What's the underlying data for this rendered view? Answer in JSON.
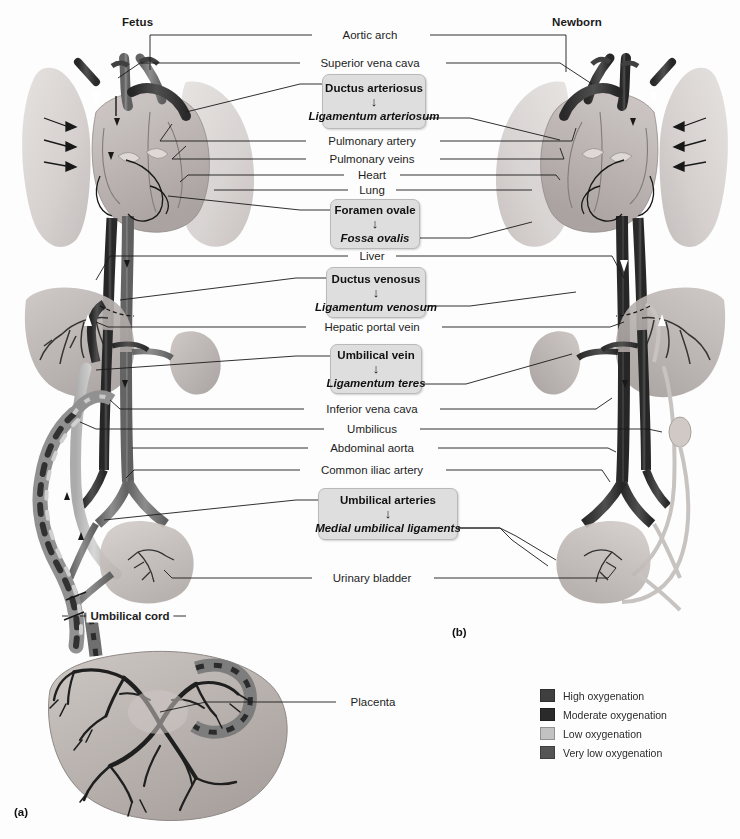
{
  "figure": {
    "panel_a_letter": "(a)",
    "panel_b_letter": "(b)",
    "left_title": "Fetus",
    "right_title": "Newborn"
  },
  "labels": [
    {
      "id": "aortic-arch",
      "text": "Aortic arch",
      "bold": false,
      "x": 370,
      "y": 35
    },
    {
      "id": "superior-vena-cava",
      "text": "Superior vena cava",
      "bold": false,
      "x": 370,
      "y": 63
    },
    {
      "id": "pulmonary-artery",
      "text": "Pulmonary artery",
      "bold": false,
      "x": 372,
      "y": 141
    },
    {
      "id": "pulmonary-veins",
      "text": "Pulmonary veins",
      "bold": false,
      "x": 372,
      "y": 159
    },
    {
      "id": "heart",
      "text": "Heart",
      "bold": false,
      "x": 372,
      "y": 175
    },
    {
      "id": "lung",
      "text": "Lung",
      "bold": false,
      "x": 372,
      "y": 190
    },
    {
      "id": "liver",
      "text": "Liver",
      "bold": false,
      "x": 372,
      "y": 256
    },
    {
      "id": "hepatic-portal-vein",
      "text": "Hepatic portal vein",
      "bold": false,
      "x": 372,
      "y": 327
    },
    {
      "id": "inferior-vena-cava",
      "text": "Inferior vena cava",
      "bold": false,
      "x": 372,
      "y": 409
    },
    {
      "id": "umbilicus",
      "text": "Umbilicus",
      "bold": false,
      "x": 372,
      "y": 429
    },
    {
      "id": "abdominal-aorta",
      "text": "Abdominal aorta",
      "bold": false,
      "x": 372,
      "y": 448
    },
    {
      "id": "common-iliac-artery",
      "text": "Common iliac artery",
      "bold": false,
      "x": 372,
      "y": 470
    },
    {
      "id": "urinary-bladder",
      "text": "Urinary bladder",
      "bold": false,
      "x": 372,
      "y": 578
    },
    {
      "id": "umbilical-cord",
      "text": "Umbilical cord",
      "bold": true,
      "x": 130,
      "y": 616
    },
    {
      "id": "placenta",
      "text": "Placenta",
      "bold": false,
      "x": 373,
      "y": 702
    }
  ],
  "transition_boxes": [
    {
      "id": "ductus-arteriosus",
      "top": "Ductus arteriosus",
      "arrow": "↓",
      "bottom": "Ligamentum arteriosum",
      "x": 322,
      "y": 74,
      "w": 104,
      "h": 55
    },
    {
      "id": "foramen-ovale",
      "top": "Foramen ovale",
      "arrow": "↓",
      "bottom": "Fossa ovalis",
      "x": 330,
      "y": 199,
      "w": 90,
      "h": 50
    },
    {
      "id": "ductus-venosus",
      "top": "Ductus venosus",
      "arrow": "↓",
      "bottom": "Ligamentum venosum",
      "x": 326,
      "y": 267,
      "w": 100,
      "h": 51
    },
    {
      "id": "umbilical-vein",
      "top": "Umbilical vein",
      "arrow": "↓",
      "bottom": "Ligamentum teres",
      "x": 330,
      "y": 344,
      "w": 92,
      "h": 50
    },
    {
      "id": "umbilical-arteries",
      "top": "Umbilical arteries",
      "arrow": "↓",
      "bottom": "Medial umbilical ligaments",
      "x": 318,
      "y": 488,
      "w": 140,
      "h": 52
    }
  ],
  "legend": {
    "items": [
      {
        "label": "High oxygenation",
        "color": "#3f3f3f"
      },
      {
        "label": "Moderate oxygenation",
        "color": "#2a2a2a"
      },
      {
        "label": "Low oxygenation",
        "color": "#c2c2c2"
      },
      {
        "label": "Very low oxygenation",
        "color": "#555555"
      }
    ]
  },
  "palette": {
    "line": "#1a1a1a",
    "box_fill": "#dedede",
    "box_border": "#b9b9b9",
    "page_bg": "#fdfdfd",
    "tissue_light": "#d9d4d2",
    "tissue_mid": "#b9b2b0",
    "vessel_dark": "#3a3a3a",
    "vessel_light": "#bdbdbd"
  }
}
